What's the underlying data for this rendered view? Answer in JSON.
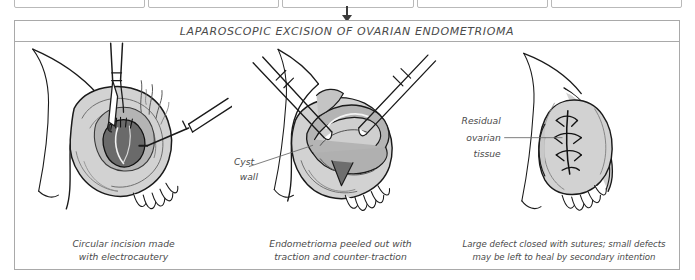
{
  "top_strip": {
    "box_count": 5,
    "note": "partially visible row of boxes cut off at top edge"
  },
  "connector": {
    "icon": "down-arrow"
  },
  "figure": {
    "title": "LAPAROSCOPIC EXCISION OF OVARIAN ENDOMETRIOMA",
    "panels": [
      {
        "id": "panel-1",
        "caption_lines": [
          "Circular incision made",
          "with electrocautery"
        ],
        "labels": [],
        "instruments": [
          "grasping-forceps",
          "electrocautery-hook"
        ],
        "features": [
          "ovary",
          "endometrioma-cyst",
          "smoke-wisps",
          "fimbriae",
          "uterus-edge"
        ]
      },
      {
        "id": "panel-2",
        "caption_lines": [
          "Endometrioma peeled out with",
          "traction and counter-traction"
        ],
        "labels": [
          {
            "text_lines": [
              "Cyst",
              "wall"
            ],
            "anchor": "right"
          }
        ],
        "instruments": [
          "grasping-forceps-left",
          "grasping-forceps-right"
        ],
        "features": [
          "ovary",
          "cyst-wall-peeling",
          "fimbriae",
          "uterus-edge"
        ]
      },
      {
        "id": "panel-3",
        "caption_lines": [
          "Large defect closed with sutures; small defects",
          "may be left to heal by secondary intention"
        ],
        "labels": [
          {
            "text_lines": [
              "Residual",
              "ovarian",
              "tissue"
            ],
            "anchor": "left"
          }
        ],
        "instruments": [],
        "features": [
          "ovary",
          "sutures",
          "fimbriae",
          "fallopian-tube"
        ]
      }
    ]
  },
  "colors": {
    "frame_border": "#a9a9a9",
    "title_text": "#4a4a4a",
    "caption_text": "#4b4b4b",
    "ink": "#1a1a1a",
    "tissue_light": "#d2d2d2",
    "tissue_mid": "#b4b4b4",
    "tissue_dark": "#8e8e8e",
    "cyst_dark": "#6a6a6a",
    "white": "#ffffff"
  }
}
